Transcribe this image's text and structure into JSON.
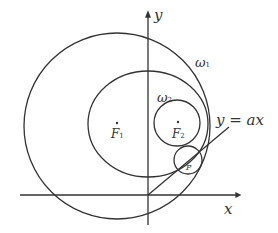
{
  "diagram": {
    "axes": {
      "x_label": "x",
      "y_label": "y"
    },
    "curves": {
      "omega1": {
        "label": "ω",
        "sub": "1"
      },
      "omega2": {
        "label": "ω",
        "sub": "2"
      },
      "line": {
        "label": "y = ax"
      }
    },
    "points": {
      "F1": {
        "label": "F",
        "sub": "1"
      },
      "F2": {
        "label": "F",
        "sub": "2"
      },
      "P": {
        "label": "P"
      }
    },
    "colors": {
      "stroke": "#333333"
    }
  }
}
